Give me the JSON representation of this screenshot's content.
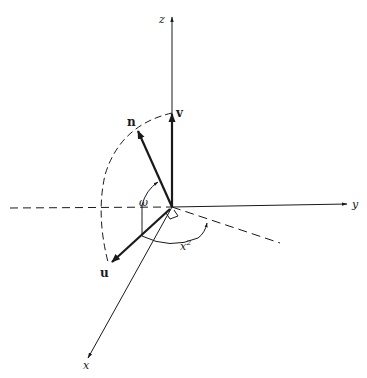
{
  "diagram": {
    "type": "3d-coordinate-frame",
    "axes": {
      "z": {
        "label": "z"
      },
      "y": {
        "label": "y"
      },
      "x": {
        "label": "x"
      }
    },
    "vectors": {
      "v": {
        "label": "v"
      },
      "n": {
        "label": "n"
      },
      "u": {
        "label": "u"
      }
    },
    "angles": {
      "omega": {
        "label": "ω"
      },
      "chi": {
        "label": "x",
        "superscript": "2"
      }
    },
    "colors": {
      "ink": "#1a1a1a",
      "background": "#ffffff"
    }
  }
}
